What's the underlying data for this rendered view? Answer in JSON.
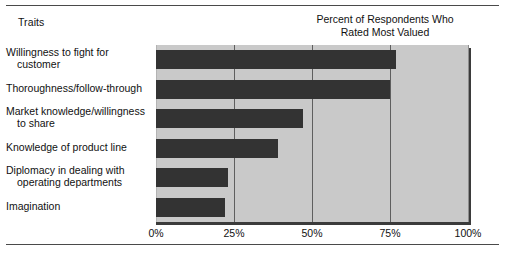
{
  "header": {
    "traits_label": "Traits",
    "title_line1": "Percent of Respondents Who",
    "title_line2": "Rated Most Valued"
  },
  "chart_data": {
    "type": "bar",
    "orientation": "horizontal",
    "title": "Percent of Respondents Who Rated Most Valued",
    "xlabel": "",
    "ylabel": "Traits",
    "xlim": [
      0,
      100
    ],
    "grid": true,
    "legend": "none",
    "tick_labels": [
      "0%",
      "25%",
      "50%",
      "75%",
      "100%"
    ],
    "tick_values": [
      0,
      25,
      50,
      75,
      100
    ],
    "categories": [
      "Willingness to fight for customer",
      "Thoroughness/follow-through",
      "Market knowledge/willingness to share",
      "Knowledge of product line",
      "Diplomacy in dealing with operating departments",
      "Imagination"
    ],
    "values": [
      77,
      75,
      47,
      39,
      23,
      22
    ],
    "bar_color": "#333333",
    "plot_background": "#c9c9c9"
  },
  "category_lines": [
    [
      "Willingness to fight for",
      "customer"
    ],
    [
      "Thoroughness/follow-through"
    ],
    [
      "Market knowledge/willingness",
      "to share"
    ],
    [
      "Knowledge of product line"
    ],
    [
      "Diplomacy in dealing with",
      "operating departments"
    ],
    [
      "Imagination"
    ]
  ]
}
